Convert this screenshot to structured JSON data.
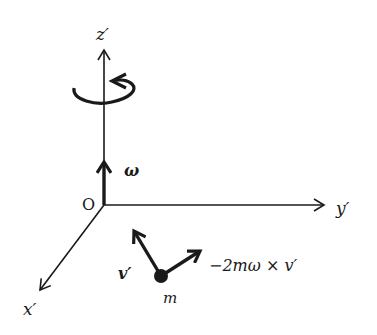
{
  "diagram": {
    "type": "rotating-reference-frame",
    "axes": {
      "x": {
        "label": "x′"
      },
      "y": {
        "label": "y′"
      },
      "z": {
        "label": "z′"
      }
    },
    "origin": {
      "label": "O"
    },
    "angular_velocity": {
      "label": "ω"
    },
    "particle": {
      "label": "m"
    },
    "velocity": {
      "label": "v′"
    },
    "coriolis_force": {
      "label": "−2mω × v′"
    },
    "rotation_indicator": {
      "direction": "counterclockwise"
    },
    "colors": {
      "ink": "#1a1a1a",
      "background": "#ffffff"
    }
  }
}
